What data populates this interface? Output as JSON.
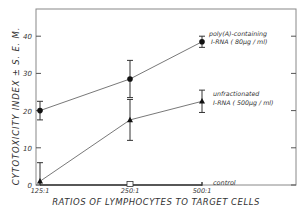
{
  "chart_data": {
    "type": "line",
    "title": "",
    "xlabel": "RATIOS OF LYMPHOCYTES TO TARGET CELLS",
    "ylabel": "CYTOTOXICITY INDEX ± S. E. M.",
    "categories": [
      "125:1",
      "250:1",
      "500:1"
    ],
    "ylim": [
      0,
      45
    ],
    "yticks": [
      0,
      10,
      20,
      30,
      40
    ],
    "grid": false,
    "series": [
      {
        "name": "poly(A)-containing I-RNA (80µg/ml)",
        "label_line1": "poly(A)-containing",
        "label_line2": "I-RNA ( 80µg / ml)",
        "marker": "filled-circle",
        "values": [
          20,
          28.5,
          38.5
        ],
        "err": [
          2.5,
          5,
          1.5
        ]
      },
      {
        "name": "unfractionated I-RNA (500µg/ml)",
        "label_line1": "unfractionated",
        "label_line2": "I-RNA ( 500µg / ml)",
        "marker": "filled-triangle",
        "values": [
          1,
          17.5,
          22.5
        ],
        "err": [
          5,
          5.5,
          3
        ]
      },
      {
        "name": "control",
        "label_line1": "control",
        "marker": "open-square",
        "values": [
          0,
          0,
          0
        ],
        "err": [
          0,
          0,
          0
        ]
      }
    ]
  }
}
